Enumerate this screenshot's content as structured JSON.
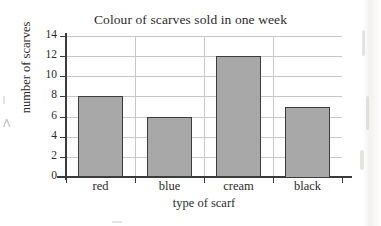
{
  "chart_data": {
    "type": "bar",
    "title": "Colour of scarves sold in one week",
    "xlabel": "type of scarf",
    "ylabel": "number of scarves",
    "categories": [
      "red",
      "blue",
      "cream",
      "black"
    ],
    "values": [
      8,
      6,
      12,
      7
    ],
    "ylim": [
      0,
      14
    ],
    "ytick_labels": [
      "0",
      "2",
      "4",
      "6",
      "8",
      "10",
      "12",
      "14"
    ],
    "ytick_values": [
      0,
      2,
      4,
      6,
      8,
      10,
      12,
      14
    ],
    "grid": "horizontal-and-vertical",
    "legend": "none",
    "bar_fill_color": "#a8a8a8",
    "bar_border_color": "#3c3c3c",
    "gridline_color": "#c8c8c8",
    "axis_color": "#3a3a3a",
    "text_color": "#2b2b2b",
    "background_color": "#ffffff"
  }
}
